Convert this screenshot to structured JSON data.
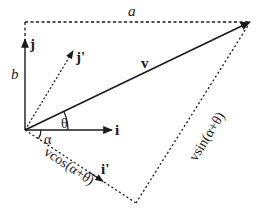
{
  "diagram": {
    "colors": {
      "line": "#1a1a1a",
      "background": "#ffffff"
    },
    "labels": {
      "a": "a",
      "b": "b",
      "j": "j",
      "j_prime": "j'",
      "i": "i",
      "i_prime": "i'",
      "v": "v",
      "theta": "θ",
      "alpha": "α",
      "vcos": "vcos(α+θ)",
      "vsin": "vsin(α+θ)"
    }
  }
}
